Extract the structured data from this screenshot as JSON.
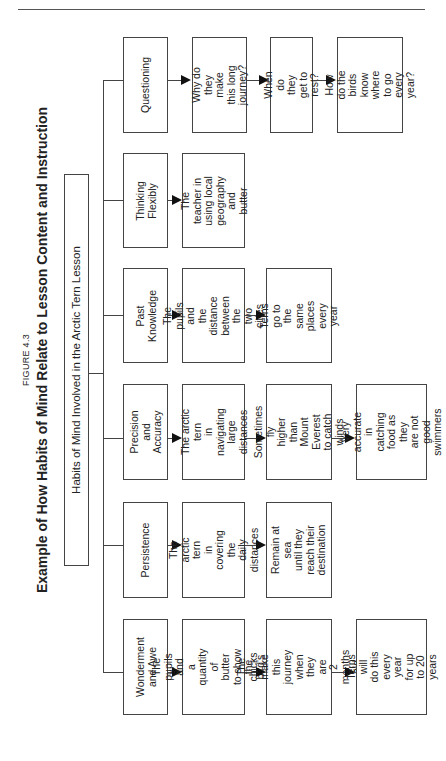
{
  "figure": {
    "label": "FIGURE 4.3",
    "title": "Example of How Habits of Mind Relate to Lesson Content and Instruction"
  },
  "root": {
    "label": "Habits of Mind Involved in the Arctic Tern Lesson"
  },
  "rows": [
    {
      "habit": "Questioning",
      "steps": [
        "Why do they\nmake this long\njourney?",
        "When do they\nget to rest?",
        "How do the\nbirds know\nwhere to go\nevery year?"
      ]
    },
    {
      "habit": "Thinking\nFlexibly",
      "steps": [
        "The teacher in\nusing local\ngeography and\nbutter"
      ]
    },
    {
      "habit": "Past\nKnowledge",
      "steps": [
        "The pupils and\nthe distance\nbetween the\ntwo cities",
        "Terns go to the\nsame places\nevery year"
      ]
    },
    {
      "habit": "Precision and\nAccuracy",
      "steps": [
        "The arctic tern\nin navigating\nlarge distances",
        "Sometimes fly\nhigher than\nMount Everest\nto catch winds",
        "Very accurate\nin catching\nfood as they\nare not good\nswimmers"
      ]
    },
    {
      "habit": "Persistence",
      "steps": [
        "The arctic tern\nin covering the\ndaily distances",
        "Remain at sea\nuntil they\nreach their\ndestination"
      ]
    },
    {
      "habit": "Wonderment\nand Awe",
      "steps": [
        "The pupils and\na quantity of\nbutter to show\nthe bird's size",
        "The chicks make\nthis journey\nwhen they are\n2 months old",
        "Terns will\ndo this every\nyear for up\nto 20 years"
      ]
    }
  ],
  "colors": {
    "line": "#444444",
    "arrow": "#111111",
    "background": "#ffffff"
  }
}
